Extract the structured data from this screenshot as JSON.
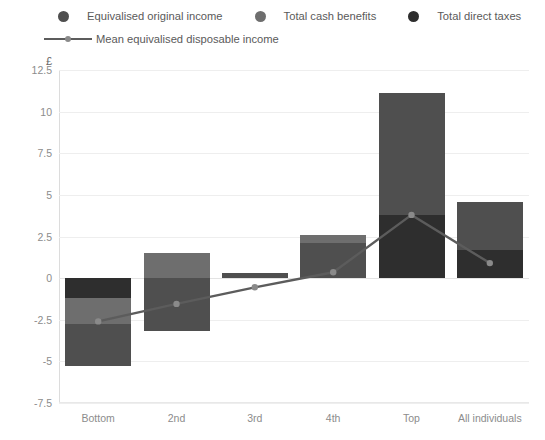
{
  "legend": {
    "items": [
      {
        "label": "Equivalised original income",
        "color": "#4f4f4f",
        "icon": "legend-dot-icon"
      },
      {
        "label": "Total cash benefits",
        "color": "#6e6e6e",
        "icon": "legend-dot-icon"
      },
      {
        "label": "Total direct taxes",
        "color": "#2e2e2e",
        "icon": "legend-dot-icon"
      }
    ],
    "line_item": {
      "label": "Mean equivalised disposable income",
      "color": "#5c5c5c",
      "icon": "legend-line-icon"
    }
  },
  "chart_data": {
    "type": "bar",
    "subtype": "stacked-bar-with-line",
    "title": "",
    "xlabel": "",
    "ylabel": "£",
    "unit": "£",
    "categories": [
      "Bottom",
      "2nd",
      "3rd",
      "4th",
      "Top",
      "All individuals"
    ],
    "ylim": [
      -7.5,
      12.5
    ],
    "yticks": [
      "12.5",
      "10",
      "7.5",
      "5",
      "2.5",
      "0",
      "-2.5",
      "-5",
      "-7.5"
    ],
    "ytick_values": [
      12.5,
      10,
      7.5,
      5,
      2.5,
      0,
      -2.5,
      -5,
      -7.5
    ],
    "grid": true,
    "legend_position": "top",
    "series": [
      {
        "name": "Equivalised original income",
        "color": "#4f4f4f",
        "values": [
          -3.2,
          -3.2,
          0.3,
          2.6,
          11.1,
          4.6
        ]
      },
      {
        "name": "Total cash benefits",
        "color": "#6e6e6e",
        "values": [
          1.55,
          1.5,
          0.3,
          0.45,
          0.0,
          0.35
        ]
      },
      {
        "name": "Total direct taxes",
        "color": "#2e2e2e",
        "values": [
          -1.2,
          -0.05,
          0.0,
          0.0,
          3.8,
          1.7
        ]
      }
    ],
    "line_series": {
      "name": "Mean equivalised disposable income",
      "color": "#5c5c5c",
      "marker_color": "#8a8a8a",
      "values": [
        -2.6,
        -1.55,
        -0.55,
        0.35,
        3.8,
        0.9
      ]
    },
    "bars": [
      {
        "category": "Bottom",
        "segments": [
          {
            "series": "Total direct taxes",
            "from": 0,
            "to": -1.2,
            "color": "#2e2e2e"
          },
          {
            "series": "Total cash benefits",
            "from": -1.2,
            "to": -2.75,
            "color": "#6e6e6e"
          },
          {
            "series": "Equivalised original income",
            "from": -2.75,
            "to": -5.25,
            "color": "#4f4f4f"
          }
        ]
      },
      {
        "category": "2nd",
        "segments": [
          {
            "series": "Total cash benefits",
            "from": 1.5,
            "to": 0,
            "color": "#6e6e6e"
          },
          {
            "series": "Equivalised original income",
            "from": 0,
            "to": -3.2,
            "color": "#4f4f4f"
          }
        ]
      },
      {
        "category": "3rd",
        "segments": [
          {
            "series": "Equivalised original income",
            "from": 0.3,
            "to": 0,
            "color": "#4f4f4f"
          }
        ]
      },
      {
        "category": "4th",
        "segments": [
          {
            "series": "Total cash benefits",
            "from": 2.6,
            "to": 2.1,
            "color": "#6e6e6e"
          },
          {
            "series": "Equivalised original income",
            "from": 2.1,
            "to": 0,
            "color": "#4f4f4f"
          }
        ]
      },
      {
        "category": "Top",
        "segments": [
          {
            "series": "Equivalised original income",
            "from": 11.1,
            "to": 3.8,
            "color": "#4f4f4f"
          },
          {
            "series": "Total direct taxes",
            "from": 3.8,
            "to": 0,
            "color": "#2e2e2e"
          }
        ]
      },
      {
        "category": "All individuals",
        "segments": [
          {
            "series": "Equivalised original income",
            "from": 4.6,
            "to": 1.7,
            "color": "#4f4f4f"
          },
          {
            "series": "Total direct taxes",
            "from": 1.7,
            "to": 0,
            "color": "#2e2e2e"
          }
        ]
      }
    ]
  }
}
